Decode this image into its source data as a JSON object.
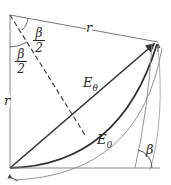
{
  "diagram": {
    "labels": {
      "half_angle_top_num": "β",
      "half_angle_top_den": "2",
      "half_angle_left_num": "β",
      "half_angle_left_den": "2",
      "r_top": "r",
      "r_left": "r",
      "e_theta_main": "E",
      "e_theta_sub": "θ",
      "e_zero_main": "E",
      "e_zero_sub": "0",
      "beta": "β"
    },
    "colors": {
      "line": "#555555",
      "bold": "#333333",
      "thin": "#888888"
    }
  }
}
